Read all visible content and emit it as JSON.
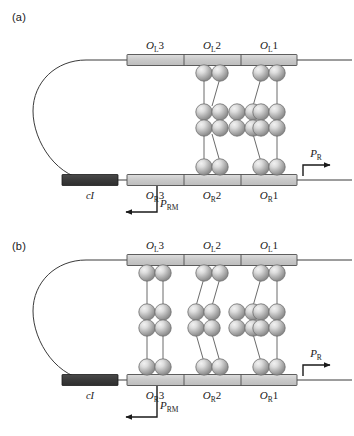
{
  "figure": {
    "panels": [
      {
        "id": "a",
        "label": "(a)",
        "gene_label": "cI",
        "left_operators": [
          "O",
          "L",
          "3",
          "O",
          "L",
          "2",
          "O",
          "L",
          "1"
        ],
        "operator_top": [
          {
            "base": "O",
            "sub": "L",
            "num": "3"
          },
          {
            "base": "O",
            "sub": "L",
            "num": "2"
          },
          {
            "base": "O",
            "sub": "L",
            "num": "1"
          }
        ],
        "operator_bottom": [
          {
            "base": "O",
            "sub": "R",
            "num": "3"
          },
          {
            "base": "O",
            "sub": "R",
            "num": "2"
          },
          {
            "base": "O",
            "sub": "R",
            "num": "1"
          }
        ],
        "promoter_right": {
          "base": "P",
          "sub": "R"
        },
        "promoter_rm": {
          "base": "P",
          "sub": "RM"
        },
        "octamer_columns": [
          2,
          3
        ],
        "octamer_count": 2,
        "tetramer_sites": [
          "OL2-OR2",
          "OL1-OR1"
        ]
      },
      {
        "id": "b",
        "label": "(b)",
        "gene_label": "cI",
        "operator_top": [
          {
            "base": "O",
            "sub": "L",
            "num": "3"
          },
          {
            "base": "O",
            "sub": "L",
            "num": "2"
          },
          {
            "base": "O",
            "sub": "L",
            "num": "1"
          }
        ],
        "operator_bottom": [
          {
            "base": "O",
            "sub": "R",
            "num": "3"
          },
          {
            "base": "O",
            "sub": "R",
            "num": "2"
          },
          {
            "base": "O",
            "sub": "R",
            "num": "1"
          }
        ],
        "promoter_right": {
          "base": "P",
          "sub": "R"
        },
        "promoter_rm": {
          "base": "P",
          "sub": "RM"
        },
        "octamer_columns": [
          1,
          2,
          3
        ],
        "octamer_count": 3,
        "tetramer_sites": [
          "OL3-OR3",
          "OL2-OR2",
          "OL1-OR1"
        ]
      }
    ],
    "colors": {
      "dna_bar_fill": "#cccccc",
      "dna_bar_stroke": "#4d4d4d",
      "gene_box_fill": "#3a3a3a",
      "gene_box_stroke": "#1a1a1a",
      "sphere_light": "#e8e8e8",
      "sphere_mid": "#b5b5b5",
      "sphere_dark": "#8e8e8e",
      "sphere_stroke": "#666666",
      "dna_line": "#3a3a3a",
      "arrow": "#1a1a1a",
      "text": "#1a1a1a",
      "background": "#ffffff"
    }
  }
}
